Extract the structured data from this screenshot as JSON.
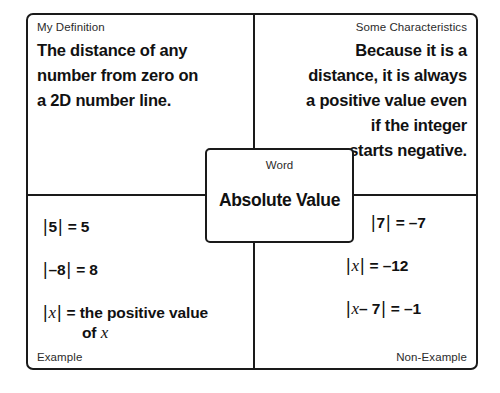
{
  "diagram": {
    "type": "frayer-model",
    "center": {
      "kicker": "Word",
      "term": "Absolute Value"
    },
    "quadrants": {
      "top_left": {
        "label": "My Definition",
        "align": "left",
        "lines": [
          "The distance of any",
          "number from zero on",
          "a 2D number line."
        ]
      },
      "top_right": {
        "label": "Some Characteristics",
        "align": "right",
        "lines": [
          "Because it is a",
          "distance, it is always",
          "a positive value even",
          "if the integer",
          "starts negative."
        ]
      },
      "bottom_left": {
        "label": "Example",
        "equations": [
          {
            "lhs_bar_open": "|",
            "lhs": "5",
            "lhs_bar_close": "|",
            "eq": "=",
            "rhs": "5"
          },
          {
            "lhs_bar_open": "|",
            "lhs": "–8",
            "lhs_bar_close": "|",
            "eq": "=",
            "rhs": "8"
          },
          {
            "lhs_bar_open": "|",
            "lhs_var": "x",
            "lhs_bar_close": "|",
            "eq": "=",
            "rhs": "the positive value",
            "rhs_cont_prefix": "of",
            "rhs_cont_var": "x"
          }
        ]
      },
      "bottom_right": {
        "label": "Non-Example",
        "equations": [
          {
            "lhs_bar_open": "|",
            "lhs": "7",
            "lhs_bar_close": "|",
            "eq": "=",
            "rhs": "–7",
            "indent": true
          },
          {
            "lhs_bar_open": "|",
            "lhs_var": "x",
            "lhs_bar_close": "|",
            "eq": "=",
            "rhs": "–12"
          },
          {
            "lhs_bar_open": "|",
            "lhs_var": "x",
            "lhs_mid": "– 7",
            "lhs_bar_close": "|",
            "eq": "=",
            "rhs": "–1"
          }
        ]
      }
    },
    "colors": {
      "stroke": "#1a1a1a",
      "text": "#111111",
      "label": "#2b2b2b",
      "background": "#ffffff"
    }
  }
}
